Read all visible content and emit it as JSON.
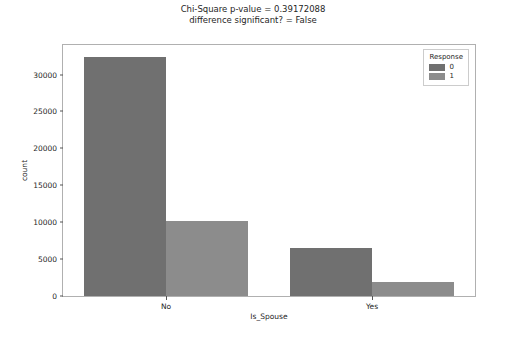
{
  "chart_data": {
    "type": "bar",
    "title": "Chi-Square p-value = 0.39172088\ndifference significant? = False",
    "title_line1": "Chi-Square p-value = 0.39172088",
    "title_line2": "difference significant? = False",
    "xlabel": "Is_Spouse",
    "ylabel": "count",
    "categories": [
      "No",
      "Yes"
    ],
    "legend_title": "Response",
    "legend_position": "upper right",
    "grid": false,
    "ylim": [
      0,
      34000
    ],
    "yticks": [
      0,
      5000,
      10000,
      15000,
      20000,
      25000,
      30000
    ],
    "ytick_labels": [
      "0",
      "5000",
      "10000",
      "15000",
      "20000",
      "25000",
      "30000"
    ],
    "series": [
      {
        "name": "0",
        "color": "#707070",
        "values": [
          32400,
          6450
        ]
      },
      {
        "name": "1",
        "color": "#8c8c8c",
        "values": [
          10200,
          1950
        ]
      }
    ]
  }
}
